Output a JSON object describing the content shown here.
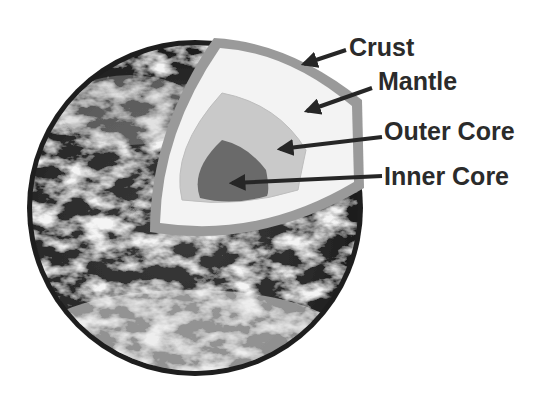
{
  "diagram": {
    "layers": [
      {
        "id": "crust",
        "label": "Crust",
        "color": "#9a9a9a"
      },
      {
        "id": "mantle",
        "label": "Mantle",
        "color": "#f3f3f3"
      },
      {
        "id": "outer-core",
        "label": "Outer Core",
        "color": "#c9c9c9"
      },
      {
        "id": "inner-core",
        "label": "Inner Core",
        "color": "#6a6a6a"
      }
    ],
    "globe": {
      "image": "earth-from-space-grayscale",
      "rim_color": "#1e1e1e"
    },
    "arrow_color": "#262626"
  }
}
